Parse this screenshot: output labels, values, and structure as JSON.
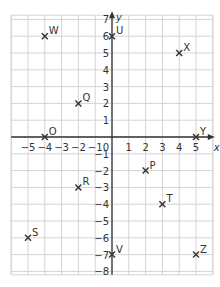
{
  "diagram": {
    "type": "coordinate-grid",
    "x_axis_label": "x",
    "y_axis_label": "y",
    "origin_label": "0",
    "xlim": [
      -6,
      6
    ],
    "ylim": [
      -8,
      7
    ],
    "x_ticks": [
      -5,
      -4,
      -3,
      -2,
      -1,
      1,
      2,
      3,
      4,
      5
    ],
    "y_ticks": [
      7,
      6,
      5,
      4,
      3,
      2,
      1,
      -1,
      -2,
      -3,
      -4,
      -5,
      -6,
      -7,
      -8
    ],
    "points": [
      {
        "label": "W",
        "x": -4,
        "y": 6
      },
      {
        "label": "U",
        "x": 0,
        "y": 6
      },
      {
        "label": "X",
        "x": 4,
        "y": 5
      },
      {
        "label": "Q",
        "x": -2,
        "y": 2
      },
      {
        "label": "O",
        "x": -4,
        "y": 0
      },
      {
        "label": "Y",
        "x": 5,
        "y": 0
      },
      {
        "label": "P",
        "x": 2,
        "y": -2
      },
      {
        "label": "R",
        "x": -2,
        "y": -3
      },
      {
        "label": "T",
        "x": 3,
        "y": -4
      },
      {
        "label": "S",
        "x": -5,
        "y": -6
      },
      {
        "label": "V",
        "x": 0,
        "y": -7
      },
      {
        "label": "Z",
        "x": 5,
        "y": -7
      }
    ],
    "colors": {
      "grid": "#d4d4d4",
      "axis": "#333333",
      "marker": "#333333"
    }
  }
}
